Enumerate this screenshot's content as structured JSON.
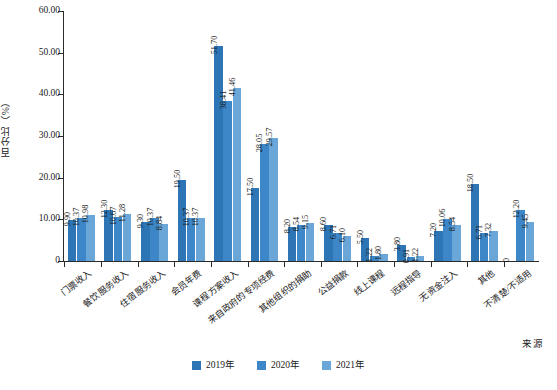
{
  "chart_data": {
    "type": "bar",
    "title": "",
    "subtitle": "",
    "xlabel": "",
    "ylabel": "百分比（%）",
    "ylim": [
      0,
      60
    ],
    "ytick_labels": [
      "0",
      "10.00",
      "20.00",
      "30.00",
      "40.00",
      "50.00",
      "60.00"
    ],
    "ytick_values": [
      0,
      10,
      20,
      30,
      40,
      50,
      60
    ],
    "grid": false,
    "legend_position": "bottom-center",
    "categories": [
      "门票收入",
      "餐饮服务收入",
      "住宿服务收入",
      "会员年费",
      "课程方案收入",
      "来自政府的专项经费",
      "其他组织的捐助",
      "公益捐款",
      "线上课程",
      "远程指导",
      "无资金注入",
      "其他",
      "不清楚/不适用"
    ],
    "series": [
      {
        "name": "2019年",
        "color": "#2e75b6",
        "values": [
          9.9,
          12.3,
          9.3,
          19.5,
          51.7,
          17.5,
          8.2,
          8.6,
          5.5,
          3.8,
          7.2,
          18.5,
          0
        ],
        "labels": [
          "9.90",
          "12.30",
          "9.30",
          "19.50",
          "51.70",
          "17.50",
          "8.20",
          "8.60",
          "5.50",
          "3.80",
          "7.20",
          "18.50",
          "0"
        ]
      },
      {
        "name": "2020年",
        "color": "#3d87c9",
        "values": [
          10.37,
          10.67,
          10.37,
          10.37,
          38.41,
          28.05,
          8.54,
          6.71,
          1.22,
          0.91,
          10.06,
          6.71,
          12.2
        ],
        "labels": [
          "10.37",
          "10.67",
          "10.37",
          "10.37",
          "38.41",
          "28.05",
          "8.54",
          "6.71",
          "1.22",
          "0.91",
          "10.06",
          "6.71",
          "12.20"
        ]
      },
      {
        "name": "2021年",
        "color": "#6aa7d8",
        "values": [
          10.98,
          11.28,
          8.84,
          10.37,
          41.46,
          29.57,
          9.15,
          6.1,
          1.8,
          1.22,
          8.54,
          7.32,
          9.45
        ],
        "labels": [
          "10.98",
          "11.28",
          "8.84",
          "10.37",
          "41.46",
          "29.57",
          "9.15",
          "6.10",
          "1.80",
          "1.22",
          "8.54",
          "7.32",
          "9.45"
        ]
      }
    ]
  },
  "legend": {
    "items": [
      {
        "label": "2019年",
        "color": "#2e75b6"
      },
      {
        "label": "2020年",
        "color": "#3d87c9"
      },
      {
        "label": "2021年",
        "color": "#6aa7d8"
      }
    ]
  },
  "source_caption": "来源"
}
